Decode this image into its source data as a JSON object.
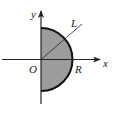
{
  "diagram": {
    "title": "",
    "labels": {
      "y_axis": "y",
      "x_axis": "x",
      "origin": "O",
      "radius": "R",
      "line": "L"
    },
    "shape": {
      "type": "right half-disc",
      "center": "O",
      "radius_label": "R",
      "fill_color": "#9c9c9c",
      "stroke_color": "#111111"
    },
    "line": {
      "name": "L",
      "passes_through": "O",
      "direction": "upper-right"
    },
    "colors": {
      "axis": "#222222",
      "fill": "#9c9c9c",
      "background": "#ffffff"
    }
  }
}
